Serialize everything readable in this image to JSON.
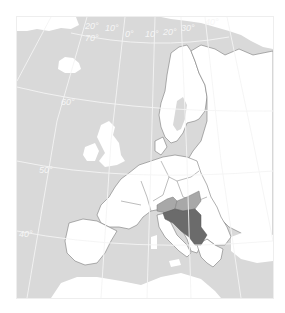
{
  "map": {
    "title": "Europe locator map",
    "colors": {
      "sea": "#d9d9d9",
      "land": "#ffffff",
      "border": "#7a7a7a",
      "graticule": "#f4f4f4",
      "highlight_dark": "#6b6b6b",
      "highlight_light": "#a8a8a8"
    },
    "longitude_labels": [
      "20°",
      "10°",
      "0°",
      "10°",
      "20°",
      "30°",
      "40°"
    ],
    "latitude_labels": [
      "70°",
      "60°",
      "50°",
      "40°"
    ],
    "highlighted_regions": [
      {
        "name": "Yugoslavia",
        "shade": "dark"
      },
      {
        "name": "Slovenia/Croatia region",
        "shade": "light"
      },
      {
        "name": "Hungary",
        "shade": "light"
      }
    ]
  }
}
